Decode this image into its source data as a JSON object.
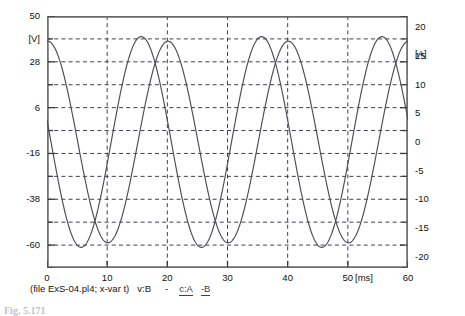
{
  "axes": {
    "left": {
      "unit": "[V]",
      "ticks": [
        "50",
        "28",
        "6",
        "-16",
        "-38",
        "-60"
      ],
      "min": -60,
      "max": 50
    },
    "right": {
      "unit": "[A]",
      "ticks": [
        "20",
        "15",
        "10",
        "5",
        "0",
        "-5",
        "-10",
        "-15",
        "-20"
      ],
      "min": -20,
      "max": 20
    },
    "x": {
      "unit": "[ms]",
      "ticks": [
        "0",
        "10",
        "20",
        "30",
        "40",
        "50",
        "60"
      ],
      "min": 0,
      "max": 60
    }
  },
  "caption": {
    "file_text": "(file ExS-04.pl4; x-var t)",
    "series_v": "v:B",
    "separator": "-",
    "series_c_a": "c:A",
    "series_c_b": "-B"
  },
  "figure_caption": {
    "number": "Fig. 5.171",
    "text": ""
  },
  "chart_data": {
    "type": "line",
    "title": "",
    "subtitle": "",
    "xlabel": "[ms]",
    "ylabel": "[V]",
    "y2label": "[A]",
    "xlim": [
      0,
      60
    ],
    "ylim": [
      -60,
      50
    ],
    "y2lim": [
      -20,
      20
    ],
    "xticks": [
      0,
      10,
      20,
      30,
      40,
      50,
      60
    ],
    "yticks": [
      50,
      28,
      6,
      -16,
      -38,
      -60
    ],
    "y2ticks": [
      20,
      15,
      10,
      5,
      0,
      -5,
      -10,
      -15,
      -20
    ],
    "grid": true,
    "grid_style": "dashed",
    "grid_h_divisions": 11,
    "grid_v_divisions": 6,
    "legend": [
      "v:B",
      "c:A",
      "-B"
    ],
    "legend_position": "below-axes",
    "series": [
      {
        "name": "v:B",
        "axis": "left",
        "amplitude": 44,
        "offset": -5,
        "period_ms": 20,
        "phase_deg": 88,
        "peak": 39,
        "trough": -49
      },
      {
        "name": "c:A",
        "axis": "left",
        "amplitude": 46,
        "offset": -5,
        "period_ms": 20,
        "phase_deg": 168,
        "peak": 41,
        "trough": -51
      }
    ]
  }
}
